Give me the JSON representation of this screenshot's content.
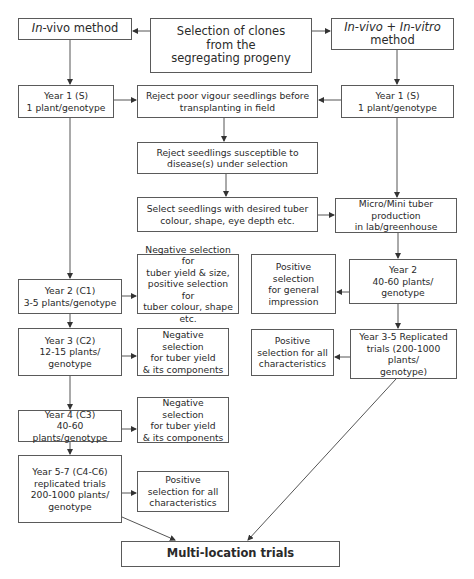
{
  "diagram": {
    "type": "flowchart",
    "title": "Selection of clones from the segregating progeny",
    "nodes": {
      "root": {
        "label": "Selection of clones\nfrom the\nsegregating progeny"
      },
      "invivo_method": {
        "label_italic": "In",
        "label_rest": "-vivo method"
      },
      "invitro_method": {
        "line1_italic_a": "In-vivo",
        "line1_plus": " + ",
        "line1_italic_b": "In-vitro",
        "line2": "method"
      },
      "left_year1": {
        "label": "Year 1 (S)\n1 plant/genotype"
      },
      "reject_poor_vigour": {
        "label": "Reject poor vigour seedlings before\ntransplanting in field"
      },
      "right_year1": {
        "label": "Year 1 (S)\n1 plant/genotype"
      },
      "reject_susceptible": {
        "label": "Reject seedlings susceptible to\ndisease(s) under selection"
      },
      "select_desired": {
        "label": "Select seedlings with desired tuber\ncolour, shape, eye depth etc."
      },
      "micro_mini": {
        "label": "Micro/Mini tuber production\nin lab/greenhouse"
      },
      "left_year2": {
        "label": "Year 2 (C1)\n3-5 plants/genotype"
      },
      "neg_sel_c1": {
        "label": "Negative selection for\ntuber yield & size,\npositive selection for\ntuber colour, shape etc."
      },
      "pos_general": {
        "label": "Positive selection\nfor general\nimpression"
      },
      "right_year2": {
        "label": "Year 2\n40-60 plants/\ngenotype"
      },
      "left_year3": {
        "label": "Year 3 (C2)\n12-15 plants/\ngenotype"
      },
      "neg_sel_c2": {
        "label": "Negative selection\nfor tuber yield\n& its components"
      },
      "pos_all_right": {
        "label": "Positive\nselection for all\ncharacteristics"
      },
      "right_year3_5": {
        "label": "Year 3-5 Replicated\ntrials (200-1000 plants/\ngenotype)"
      },
      "left_year4": {
        "label": "Year 4 (C3)\n40-60 plants/genotype"
      },
      "neg_sel_c3": {
        "label": "Negative selection\nfor tuber yield\n& its components"
      },
      "left_year5_7": {
        "label": "Year 5-7 (C4-C6)\nreplicated trials\n200-1000 plants/\ngenotype"
      },
      "pos_all_left": {
        "label": "Positive\nselection for all\ncharacteristics"
      },
      "multi_location": {
        "label": "Multi-location trials"
      }
    },
    "edges": [
      [
        "root",
        "invivo_method"
      ],
      [
        "root",
        "invitro_method"
      ],
      [
        "invivo_method",
        "left_year1"
      ],
      [
        "left_year1",
        "reject_poor_vigour"
      ],
      [
        "invitro_method",
        "right_year1"
      ],
      [
        "right_year1",
        "reject_poor_vigour"
      ],
      [
        "reject_poor_vigour",
        "reject_susceptible"
      ],
      [
        "reject_susceptible",
        "select_desired"
      ],
      [
        "select_desired",
        "micro_mini"
      ],
      [
        "right_year1",
        "micro_mini"
      ],
      [
        "left_year1",
        "left_year2"
      ],
      [
        "left_year2",
        "neg_sel_c1"
      ],
      [
        "micro_mini",
        "right_year2"
      ],
      [
        "right_year2",
        "pos_general"
      ],
      [
        "left_year2",
        "left_year3"
      ],
      [
        "left_year3",
        "neg_sel_c2"
      ],
      [
        "right_year2",
        "right_year3_5"
      ],
      [
        "right_year3_5",
        "pos_all_right"
      ],
      [
        "left_year3",
        "left_year4"
      ],
      [
        "left_year4",
        "neg_sel_c3"
      ],
      [
        "left_year4",
        "left_year5_7"
      ],
      [
        "left_year5_7",
        "pos_all_left"
      ],
      [
        "left_year5_7",
        "multi_location"
      ],
      [
        "right_year3_5",
        "multi_location"
      ]
    ],
    "colors": {
      "stroke": "#5a5a5a",
      "text": "#2a2a2a",
      "background": "#ffffff"
    }
  }
}
